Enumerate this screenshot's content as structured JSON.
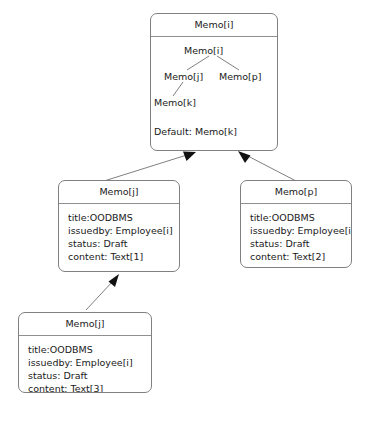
{
  "diagram": {
    "type": "uml-object-diagram",
    "background_color": "#ffffff",
    "line_color": "#808080",
    "text_color": "#1a1a1a",
    "nodes": [
      {
        "id": "memo-i",
        "header": "Memo[i]",
        "inner_tree": {
          "root": "Memo[i]",
          "child_left": "Memo[j]",
          "child_right": "Memo[p]",
          "grandchild": "Memo[k]",
          "default_line": "Default: Memo[k]"
        }
      },
      {
        "id": "memo-j-1",
        "header": "Memo[j]",
        "attributes": [
          "title:OODBMS",
          "issuedby: Employee[i]",
          "status: Draft",
          "content: Text[1]"
        ]
      },
      {
        "id": "memo-p",
        "header": "Memo[p]",
        "attributes": [
          "title:OODBMS",
          "issuedby: Employee[i]",
          "status: Draft",
          "content: Text[2]"
        ]
      },
      {
        "id": "memo-j-2",
        "header": "Memo[j]",
        "attributes": [
          "title:OODBMS",
          "issuedby: Employee[i]",
          "status: Draft",
          "content: Text[3]"
        ]
      }
    ],
    "connectors": [
      {
        "from": "memo-j-1",
        "to": "memo-i",
        "arrowhead": "filled-triangle"
      },
      {
        "from": "memo-p",
        "to": "memo-i",
        "arrowhead": "filled-triangle"
      },
      {
        "from": "memo-j-2",
        "to": "memo-j-1",
        "arrowhead": "filled-triangle"
      }
    ]
  }
}
